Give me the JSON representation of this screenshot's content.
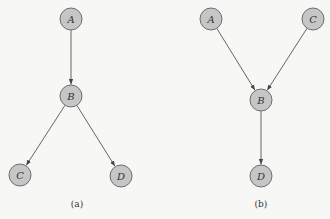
{
  "figure": {
    "subfigures": [
      {
        "caption": "(a)",
        "nodes": [
          {
            "id": "A",
            "label": "A",
            "x": 71,
            "y": 19
          },
          {
            "id": "B",
            "label": "B",
            "x": 71,
            "y": 96
          },
          {
            "id": "C",
            "label": "C",
            "x": 20,
            "y": 175
          },
          {
            "id": "D",
            "label": "D",
            "x": 121,
            "y": 176
          }
        ],
        "edges": [
          [
            "A",
            "B"
          ],
          [
            "B",
            "C"
          ],
          [
            "B",
            "D"
          ]
        ]
      },
      {
        "caption": "(b)",
        "nodes": [
          {
            "id": "A",
            "label": "A",
            "x": 211,
            "y": 19
          },
          {
            "id": "C",
            "label": "C",
            "x": 313,
            "y": 19
          },
          {
            "id": "B",
            "label": "B",
            "x": 261,
            "y": 100
          },
          {
            "id": "D",
            "label": "D",
            "x": 261,
            "y": 176
          }
        ],
        "edges": [
          [
            "A",
            "B"
          ],
          [
            "C",
            "B"
          ],
          [
            "B",
            "D"
          ]
        ]
      }
    ]
  }
}
